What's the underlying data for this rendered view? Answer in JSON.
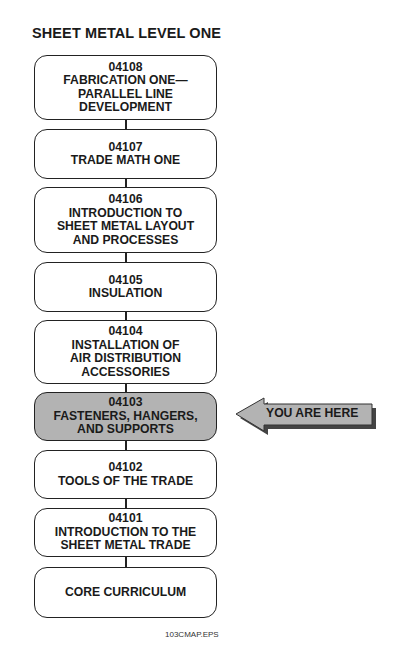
{
  "title": "SHEET METAL LEVEL ONE",
  "modules": [
    {
      "code": "04108",
      "lines": [
        "FABRICATION ONE—",
        "PARALLEL LINE",
        "DEVELOPMENT"
      ],
      "current": false
    },
    {
      "code": "04107",
      "lines": [
        "TRADE MATH ONE"
      ],
      "current": false
    },
    {
      "code": "04106",
      "lines": [
        "INTRODUCTION TO",
        "SHEET METAL LAYOUT",
        "AND PROCESSES"
      ],
      "current": false
    },
    {
      "code": "04105",
      "lines": [
        "INSULATION"
      ],
      "current": false
    },
    {
      "code": "04104",
      "lines": [
        "INSTALLATION OF",
        "AIR DISTRIBUTION",
        "ACCESSORIES"
      ],
      "current": false
    },
    {
      "code": "04103",
      "lines": [
        "FASTENERS, HANGERS,",
        "AND SUPPORTS"
      ],
      "current": true
    },
    {
      "code": "04102",
      "lines": [
        "TOOLS OF THE TRADE"
      ],
      "current": false
    },
    {
      "code": "04101",
      "lines": [
        "INTRODUCTION TO THE",
        "SHEET METAL TRADE"
      ],
      "current": false
    },
    {
      "code": "",
      "lines": [
        "CORE CURRICULUM"
      ],
      "current": false
    }
  ],
  "marker": {
    "label": "YOU ARE HERE",
    "icon": "left-arrow-icon",
    "fill": "#b3b3b3"
  },
  "caption": "103CMAP.EPS"
}
